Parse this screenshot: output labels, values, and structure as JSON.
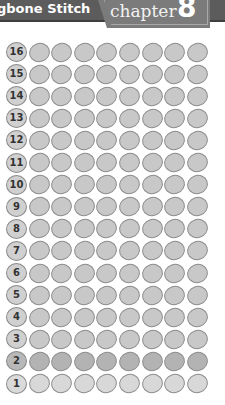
{
  "header": {
    "title": "gbone Stitch",
    "chapter_word": "chapter",
    "chapter_number": "8"
  },
  "grid": {
    "columns": 8,
    "row_labels": [
      "16",
      "15",
      "14",
      "13",
      "12",
      "11",
      "10",
      "9",
      "8",
      "7",
      "6",
      "5",
      "4",
      "3",
      "2",
      "1"
    ],
    "highlighted_rows": {
      "2": "dark",
      "1": "light"
    },
    "colors": {
      "bead": "#c8c8c8",
      "bead_dark": "#b3b3b3",
      "bead_light": "#d8d8d8",
      "outline": "#8c8c8c",
      "header": "#5c5c5c",
      "tab": "#7b7b7b"
    }
  }
}
